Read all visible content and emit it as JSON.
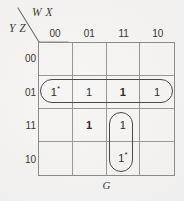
{
  "figure": {
    "kind": "karnaugh-map",
    "function_label": "G",
    "column_axis_label": "W X",
    "row_axis_label": "Y Z",
    "column_headers": [
      "00",
      "01",
      "11",
      "10"
    ],
    "row_headers": [
      "00",
      "01",
      "11",
      "10"
    ],
    "line_color": "#8d8b88",
    "oval_color": "#4a4947",
    "text_color": "#2e2d2b",
    "background_color": "#f3f2f0"
  },
  "chart_data": {
    "type": "table",
    "title": "G",
    "xlabel": "W X",
    "ylabel": "Y Z",
    "categories": [
      "00",
      "01",
      "11",
      "10"
    ],
    "row_categories": [
      "00",
      "01",
      "11",
      "10"
    ],
    "cells": [
      [
        {
          "value": "",
          "starred": false,
          "bold": false
        },
        {
          "value": "",
          "starred": false,
          "bold": false
        },
        {
          "value": "",
          "starred": false,
          "bold": false
        },
        {
          "value": "",
          "starred": false,
          "bold": false
        }
      ],
      [
        {
          "value": "1",
          "starred": true,
          "bold": false
        },
        {
          "value": "1",
          "starred": false,
          "bold": false
        },
        {
          "value": "1",
          "starred": false,
          "bold": true
        },
        {
          "value": "1",
          "starred": false,
          "bold": false
        }
      ],
      [
        {
          "value": "",
          "starred": false,
          "bold": false
        },
        {
          "value": "1",
          "starred": false,
          "bold": true
        },
        {
          "value": "1",
          "starred": false,
          "bold": false
        },
        {
          "value": "",
          "starred": false,
          "bold": false
        }
      ],
      [
        {
          "value": "",
          "starred": false,
          "bold": false
        },
        {
          "value": "",
          "starred": false,
          "bold": false
        },
        {
          "value": "1",
          "starred": true,
          "bold": false
        },
        {
          "value": "",
          "starred": false,
          "bold": false
        }
      ]
    ],
    "groups": [
      {
        "name": "row-01-all-columns",
        "cells": "YZ=01, WX=00,01,11,10",
        "orientation": "horizontal"
      },
      {
        "name": "col-11-rows-11-10",
        "cells": "WX=11, YZ=11,10",
        "orientation": "vertical"
      }
    ],
    "grid": true,
    "legend": "none"
  }
}
